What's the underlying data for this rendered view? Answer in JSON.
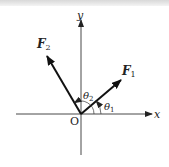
{
  "diagram": {
    "type": "force-vector-diagram",
    "origin_label": "O",
    "axes": {
      "x_label": "x",
      "y_label": "y"
    },
    "vectors": [
      {
        "name": "F1",
        "label_main": "F",
        "label_sub": "1",
        "angle_label_main": "θ",
        "angle_label_sub": "1"
      },
      {
        "name": "F2",
        "label_main": "F",
        "label_sub": "2",
        "angle_label_main": "θ",
        "angle_label_sub": "2"
      }
    ],
    "colors": {
      "line": "#222222",
      "background": "#ffffff"
    }
  }
}
